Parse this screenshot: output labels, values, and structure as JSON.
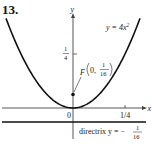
{
  "problem_number": "13.",
  "axes": {
    "x_label": "x",
    "y_label": "y",
    "origin_label": "0",
    "x_tick_label": "1/4",
    "y_tick_label": {
      "numerator": "1",
      "denominator": "4"
    }
  },
  "curve": {
    "equation_label": "y = 4x",
    "equation_exponent": "2",
    "coefficient": 4
  },
  "focus": {
    "label_letter": "F",
    "label_x": "0,",
    "label_y": {
      "numerator": "1",
      "denominator": "16"
    },
    "x": 0,
    "y": 0.0625
  },
  "directrix": {
    "label_prefix": "directrix y = −",
    "label_value": {
      "numerator": "1",
      "denominator": "16"
    },
    "y": -0.0625
  },
  "colors": {
    "ink": "#111111",
    "axis": "#444444"
  }
}
